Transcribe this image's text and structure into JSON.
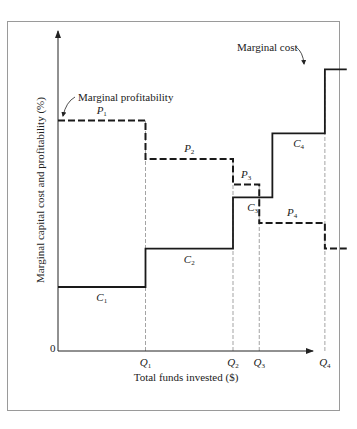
{
  "chart_data": {
    "type": "line",
    "title": "",
    "xlabel": "Total funds invested ($)",
    "ylabel": "Marginal capital cost and profitability (%)",
    "origin_label": "0",
    "x_ticks": [
      {
        "label": "Q",
        "sub": "1",
        "x": 1
      },
      {
        "label": "Q",
        "sub": "2",
        "x": 2
      },
      {
        "label": "Q",
        "sub": "3",
        "x": 2.3
      },
      {
        "label": "Q",
        "sub": "4",
        "x": 3.05
      }
    ],
    "x_max": 3.35,
    "y_max": 100,
    "series": [
      {
        "name": "Marginal cost",
        "style": "solid",
        "steps": [
          {
            "from": 0,
            "to": 1,
            "y": 20,
            "label": "C",
            "sub": "1"
          },
          {
            "from": 1,
            "to": 2,
            "y": 32,
            "label": "C",
            "sub": "2"
          },
          {
            "from": 2,
            "to": 2.45,
            "y": 48,
            "label": "C",
            "sub": "3"
          },
          {
            "from": 2.45,
            "to": 3.05,
            "y": 68,
            "label": "C",
            "sub": "4"
          },
          {
            "from": 3.05,
            "to": 3.3,
            "y": 88,
            "label": "",
            "sub": ""
          }
        ]
      },
      {
        "name": "Marginal profitability",
        "style": "dashed",
        "steps": [
          {
            "from": 0,
            "to": 1,
            "y": 72,
            "label": "P",
            "sub": "1"
          },
          {
            "from": 1,
            "to": 2,
            "y": 60,
            "label": "P",
            "sub": "2"
          },
          {
            "from": 2,
            "to": 2.3,
            "y": 52,
            "label": "P",
            "sub": "3"
          },
          {
            "from": 2.3,
            "to": 3.05,
            "y": 40,
            "label": "P",
            "sub": "4"
          },
          {
            "from": 3.05,
            "to": 3.3,
            "y": 32,
            "label": "",
            "sub": ""
          }
        ]
      }
    ],
    "annotations": [
      {
        "text": "Marginal cost",
        "points_to": "Marginal cost"
      },
      {
        "text": "Marginal profitability",
        "points_to": "Marginal profitability"
      }
    ],
    "grid": false,
    "legend": "none"
  }
}
